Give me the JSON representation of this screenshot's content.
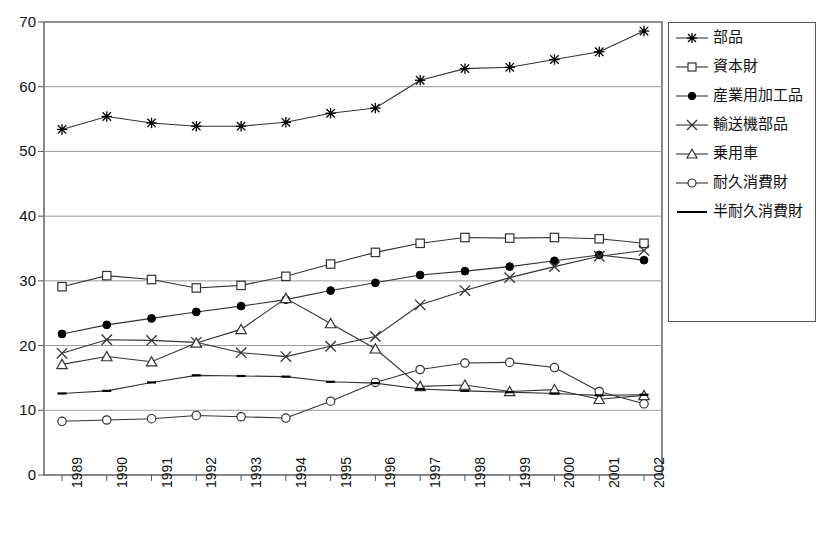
{
  "chart_data": {
    "type": "line",
    "title": "",
    "xlabel": "",
    "ylabel": "",
    "categories": [
      "1989",
      "1990",
      "1991",
      "1992",
      "1993",
      "1994",
      "1995",
      "1996",
      "1997",
      "1998",
      "1999",
      "2000",
      "2001",
      "2002"
    ],
    "ylim": [
      0,
      70
    ],
    "ytick_step": 10,
    "yticks": [
      "0",
      "10",
      "20",
      "30",
      "40",
      "50",
      "60",
      "70"
    ],
    "grid": true,
    "legend_position": "right",
    "series": [
      {
        "name": "部品",
        "marker": "star",
        "values": [
          53.4,
          55.4,
          54.4,
          53.9,
          53.9,
          54.5,
          55.9,
          56.7,
          61.0,
          62.8,
          63.0,
          64.2,
          65.4,
          68.6
        ]
      },
      {
        "name": "資本財",
        "marker": "square",
        "values": [
          29.1,
          30.8,
          30.2,
          28.9,
          29.3,
          30.7,
          32.6,
          34.4,
          35.8,
          36.7,
          36.6,
          36.7,
          36.5,
          35.8
        ]
      },
      {
        "name": "産業用加工品",
        "marker": "filled-circle",
        "values": [
          21.8,
          23.2,
          24.2,
          25.2,
          26.1,
          27.1,
          28.5,
          29.7,
          30.9,
          31.5,
          32.2,
          33.1,
          34.0,
          33.2
        ]
      },
      {
        "name": "輸送機部品",
        "marker": "cross",
        "values": [
          18.8,
          20.9,
          20.8,
          20.5,
          18.9,
          18.3,
          19.9,
          21.4,
          26.3,
          28.5,
          30.5,
          32.2,
          33.8,
          34.7
        ]
      },
      {
        "name": "乗用車",
        "marker": "triangle",
        "values": [
          17.1,
          18.3,
          17.5,
          20.4,
          22.5,
          27.3,
          23.4,
          19.5,
          13.7,
          13.9,
          12.9,
          13.2,
          11.7,
          12.3
        ]
      },
      {
        "name": "耐久消費財",
        "marker": "open-circle",
        "values": [
          8.3,
          8.5,
          8.7,
          9.2,
          9.0,
          8.8,
          11.4,
          14.3,
          16.3,
          17.3,
          17.4,
          16.6,
          12.9,
          11.0
        ]
      },
      {
        "name": "半耐久消費財",
        "marker": "dash",
        "values": [
          12.6,
          13.0,
          14.3,
          15.4,
          15.3,
          15.2,
          14.4,
          14.2,
          13.3,
          13.0,
          12.8,
          12.6,
          12.3,
          12.4
        ]
      }
    ]
  },
  "legend": {
    "entries": [
      "部品",
      "資本財",
      "産業用加工品",
      "輸送機部品",
      "乗用車",
      "耐久消費財",
      "半耐久消費財"
    ]
  },
  "colors": {
    "line": "#333333",
    "grid": "#999999",
    "axis": "#555555",
    "text": "#111111"
  }
}
